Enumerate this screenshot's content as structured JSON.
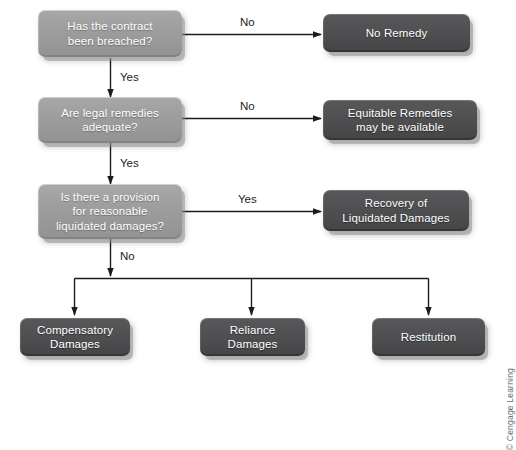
{
  "diagram": {
    "colors": {
      "decision_fill": "#9d9d9d",
      "outcome_fill": "#505052",
      "text": "#ffffff",
      "connector": "#1c1c1c",
      "background": "#ffffff",
      "credit_text": "#6d6d6d"
    },
    "nodes": [
      {
        "id": "d1",
        "type": "decision",
        "text": "Has the contract\nbeen breached?"
      },
      {
        "id": "d2",
        "type": "decision",
        "text": "Are legal remedies\nadequate?"
      },
      {
        "id": "d3",
        "type": "decision",
        "text": "Is there a provision\nfor reasonable\nliquidated damages?"
      },
      {
        "id": "o1",
        "type": "outcome",
        "text": "No Remedy"
      },
      {
        "id": "o2",
        "type": "outcome",
        "text": "Equitable Remedies\nmay be available"
      },
      {
        "id": "o3",
        "type": "outcome",
        "text": "Recovery of\nLiquidated Damages"
      },
      {
        "id": "t1",
        "type": "outcome",
        "text": "Compensatory\nDamages"
      },
      {
        "id": "t2",
        "type": "outcome",
        "text": "Reliance\nDamages"
      },
      {
        "id": "t3",
        "type": "outcome",
        "text": "Restitution"
      }
    ],
    "edge_labels": {
      "d1_no": "No",
      "d1_yes": "Yes",
      "d2_no": "No",
      "d2_yes": "Yes",
      "d3_yes": "Yes",
      "d3_no": "No"
    }
  },
  "credit": {
    "text": "© Cengage Learning"
  }
}
